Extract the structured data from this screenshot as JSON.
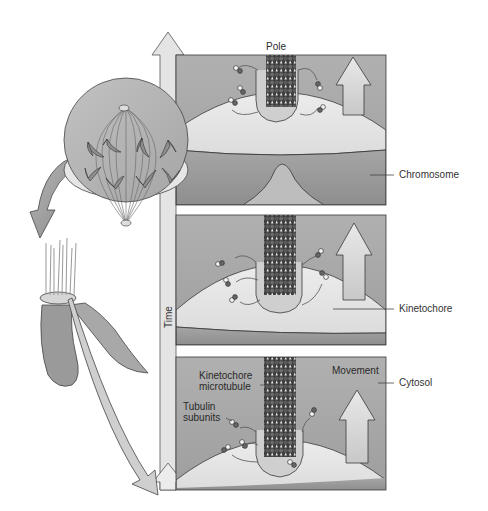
{
  "figure": {
    "colors": {
      "background": "#ffffff",
      "panel_fill": "#a9a9a9",
      "kinetochore_fill": "#e6e6e6",
      "chromosome_fill": "#9a9a9a",
      "arrow_fill": "#d8d8d8",
      "outline": "#3a3a3a",
      "microtubule_dark": "#4a4a4a",
      "microtubule_light": "#f2f2f2"
    }
  },
  "labels": {
    "pole": "Pole",
    "chromosome": "Chromosome",
    "kinetochore": "Kinetochore",
    "cytosol": "Cytosol",
    "movement": "Movement",
    "kinetochore_microtubule_line1": "Kinetochore",
    "kinetochore_microtubule_line2": "microtubule",
    "tubulin_subunits_line1": "Tubulin",
    "tubulin_subunits_line2": "subunits",
    "time": "Time"
  },
  "panels": [
    {
      "id": "panel-1",
      "label": "early"
    },
    {
      "id": "panel-2",
      "label": "middle"
    },
    {
      "id": "panel-3",
      "label": "late"
    }
  ],
  "icons": {
    "time_arrow": "up-arrow-icon",
    "movement_arrow": "up-arrow-icon",
    "zoom_arrow_cell": "curved-arrow-icon",
    "zoom_arrow_chromosome": "curved-arrow-icon"
  }
}
